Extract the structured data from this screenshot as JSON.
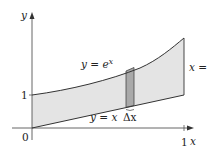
{
  "diagram": {
    "type": "region-between-curves",
    "axes": {
      "x_label": "x",
      "y_label": "y",
      "origin_label": "0",
      "x_tick_label": "1",
      "y_tick_label": "1"
    },
    "curves": {
      "upper": {
        "label": "y = e",
        "label_sup": "x",
        "equation": "y = e^x"
      },
      "lower": {
        "label": "y = x",
        "equation": "y = x"
      },
      "boundary": {
        "label": "x = 1",
        "equation": "x = 1"
      }
    },
    "strip": {
      "label": "Δx"
    },
    "colors": {
      "region_fill": "#e4e4e4",
      "strip_fill": "#a9a9a9",
      "curve_stroke": "#333333",
      "axis_stroke": "#555555"
    }
  }
}
